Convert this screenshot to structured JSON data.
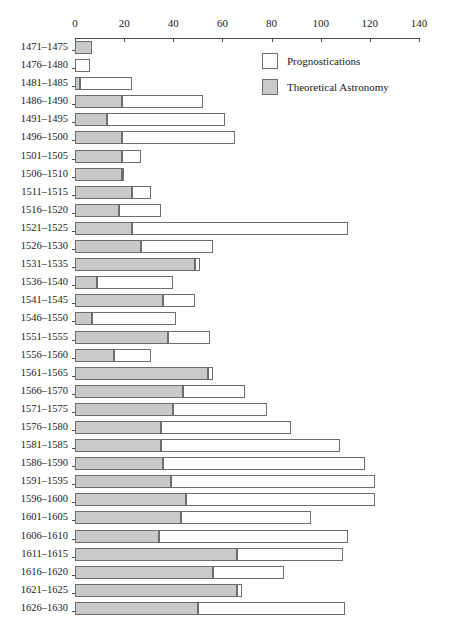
{
  "chart_data": {
    "type": "bar",
    "orientation": "horizontal",
    "stacked": true,
    "title": "",
    "xlabel": "",
    "ylabel": "",
    "xlim": [
      0,
      140
    ],
    "xticks": [
      0,
      20,
      40,
      60,
      80,
      100,
      120,
      140
    ],
    "grid": false,
    "legend_position": "top-right",
    "categories": [
      "1471–1475",
      "1476–1480",
      "1481–1485",
      "1486–1490",
      "1491–1495",
      "1496–1500",
      "1501–1505",
      "1506–1510",
      "1511–1515",
      "1516–1520",
      "1521–1525",
      "1526–1530",
      "1531–1535",
      "1536–1540",
      "1541–1545",
      "1546–1550",
      "1551–1555",
      "1556–1560",
      "1561–1565",
      "1566–1570",
      "1571–1575",
      "1576–1580",
      "1581–1585",
      "1586–1590",
      "1591–1595",
      "1596–1600",
      "1601–1605",
      "1606–1610",
      "1611–1615",
      "1616–1620",
      "1621–1625",
      "1626–1630"
    ],
    "series": [
      {
        "name": "Theoretical Astronomy",
        "color": "#c9c9c9",
        "values": [
          7,
          0,
          2,
          19,
          13,
          19,
          19,
          19,
          23,
          18,
          23,
          27,
          49,
          9,
          36,
          7,
          38,
          16,
          54,
          44,
          40,
          35,
          35,
          36,
          39,
          45,
          43,
          34,
          66,
          56,
          66,
          50
        ]
      },
      {
        "name": "Prognostications",
        "color": "#ffffff",
        "values": [
          0,
          6,
          21,
          33,
          48,
          46,
          8,
          1,
          8,
          17,
          88,
          29,
          2,
          31,
          13,
          34,
          17,
          15,
          2,
          25,
          38,
          53,
          73,
          82,
          83,
          77,
          53,
          77,
          43,
          29,
          2,
          60
        ]
      }
    ],
    "totals": [
      7,
      6,
      23,
      52,
      61,
      65,
      27,
      20,
      31,
      35,
      111,
      56,
      51,
      40,
      49,
      41,
      55,
      31,
      56,
      69,
      78,
      88,
      108,
      118,
      122,
      122,
      96,
      111,
      109,
      85,
      68,
      110
    ]
  },
  "legend": {
    "items": [
      {
        "label": "Prognostications",
        "swatch": "prog"
      },
      {
        "label": "Theoretical Astronomy",
        "swatch": "theory"
      }
    ]
  },
  "colors": {
    "theoretical_astronomy": "#c9c9c9",
    "prognostications": "#ffffff",
    "outline": "#6d6d6d",
    "axis": "#4b4b4b",
    "text": "#1a1a1a",
    "background": "#ffffff"
  }
}
